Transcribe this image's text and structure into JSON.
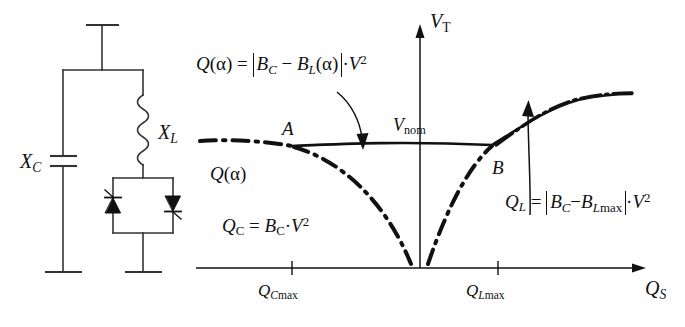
{
  "figure": {
    "type": "technical-diagram"
  },
  "circuit": {
    "label_xc": "X",
    "label_xc_sub": "C",
    "label_xl": "X",
    "label_xl_sub": "L",
    "components": [
      "busbar",
      "capacitor-branch",
      "inductor-branch",
      "thyristor-pair",
      "ground-left",
      "ground-right"
    ]
  },
  "plot": {
    "y_axis_label": "V",
    "y_axis_label_sub": "T",
    "x_axis_label": "Q",
    "x_axis_label_sub": "S",
    "v_nom_label": "V",
    "v_nom_label_sub": "nom",
    "point_a": "A",
    "point_b": "B",
    "curve_label": "Q",
    "curve_label_arg": "(α)",
    "ticks": [
      {
        "name": "Q",
        "sub_italic": "C",
        "sub_roman": "max",
        "position": "left"
      },
      {
        "name": "Q",
        "sub_italic": "L",
        "sub_roman": "max",
        "position": "right"
      }
    ]
  },
  "annotations": {
    "q_alpha": {
      "lhs_sym": "Q",
      "lhs_arg": "(α)",
      "eq": "=",
      "term1": "B",
      "term1_sub": "C",
      "minus": "−",
      "term2": "B",
      "term2_sub": "L",
      "term2_arg": "(α)",
      "dot": "·",
      "voltage": "V",
      "exponent": "2"
    },
    "q_c": {
      "lhs_sym": "Q",
      "lhs_sub": "C",
      "eq": "=",
      "term1": "B",
      "term1_sub": "C",
      "dot": "·",
      "voltage": "V",
      "exponent": "2"
    },
    "q_l": {
      "lhs_sym": "Q",
      "lhs_sub": "L",
      "eq": "=",
      "term1": "B",
      "term1_sub": "C",
      "minus": "−",
      "term2": "B",
      "term2_sub_italic": "L",
      "term2_sub_roman": "max",
      "dot": "·",
      "voltage": "V",
      "exponent": "2"
    }
  },
  "colors": {
    "ink": "#111111",
    "background": "#ffffff"
  }
}
